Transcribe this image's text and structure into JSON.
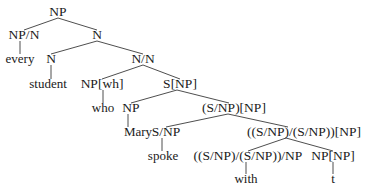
{
  "diagram": {
    "type": "syntax-tree",
    "background": "#ffffff",
    "line_color": "#3a3a3a",
    "nodes": [
      {
        "id": "n0",
        "label": "NP",
        "x": 58,
        "y": 6,
        "kind": "category"
      },
      {
        "id": "n1",
        "label": "NP/N",
        "x": 24,
        "y": 29,
        "kind": "category"
      },
      {
        "id": "n2",
        "label": "every",
        "x": 20,
        "y": 53,
        "kind": "word"
      },
      {
        "id": "n3",
        "label": "N",
        "x": 97,
        "y": 29,
        "kind": "category"
      },
      {
        "id": "n4",
        "label": "N",
        "x": 51,
        "y": 53,
        "kind": "category"
      },
      {
        "id": "n5",
        "label": "student",
        "x": 48,
        "y": 78,
        "kind": "word"
      },
      {
        "id": "n6",
        "label": "N/N",
        "x": 143,
        "y": 53,
        "kind": "category"
      },
      {
        "id": "n7",
        "label": "NP[wh]",
        "x": 102,
        "y": 78,
        "kind": "category"
      },
      {
        "id": "n8",
        "label": "who",
        "x": 103,
        "y": 102,
        "kind": "word"
      },
      {
        "id": "n9",
        "label": "S[NP]",
        "x": 180,
        "y": 78,
        "kind": "category"
      },
      {
        "id": "n10",
        "label": "NP",
        "x": 131,
        "y": 102,
        "kind": "category"
      },
      {
        "id": "n11",
        "label": "Mary",
        "x": 138,
        "y": 126,
        "kind": "word"
      },
      {
        "id": "n12",
        "label": "(S/NP)[NP]",
        "x": 234,
        "y": 102,
        "kind": "category"
      },
      {
        "id": "n13",
        "label": "S/NP",
        "x": 166,
        "y": 126,
        "kind": "category"
      },
      {
        "id": "n14",
        "label": "spoke",
        "x": 163,
        "y": 150,
        "kind": "word"
      },
      {
        "id": "n15",
        "label": "((S/NP)/(S/NP))[NP]",
        "x": 304,
        "y": 126,
        "kind": "category"
      },
      {
        "id": "n16",
        "label": "((S/NP)/(S/NP))/NP",
        "x": 248,
        "y": 150,
        "kind": "category"
      },
      {
        "id": "n17",
        "label": "with",
        "x": 246,
        "y": 173,
        "kind": "word"
      },
      {
        "id": "n18",
        "label": "NP[NP]",
        "x": 333,
        "y": 150,
        "kind": "category"
      },
      {
        "id": "n19",
        "label": "t",
        "x": 333,
        "y": 173,
        "kind": "word"
      }
    ],
    "edges": [
      {
        "from": "n0",
        "to": "n1",
        "x1": 58,
        "y1": 18,
        "x2": 24,
        "y2": 30
      },
      {
        "from": "n0",
        "to": "n3",
        "x1": 58,
        "y1": 18,
        "x2": 97,
        "y2": 30
      },
      {
        "from": "n1",
        "to": "n2",
        "x1": 20,
        "y1": 41,
        "x2": 20,
        "y2": 54
      },
      {
        "from": "n3",
        "to": "n4",
        "x1": 97,
        "y1": 41,
        "x2": 51,
        "y2": 54
      },
      {
        "from": "n3",
        "to": "n6",
        "x1": 97,
        "y1": 41,
        "x2": 143,
        "y2": 54
      },
      {
        "from": "n4",
        "to": "n5",
        "x1": 51,
        "y1": 65,
        "x2": 51,
        "y2": 79
      },
      {
        "from": "n6",
        "to": "n7",
        "x1": 143,
        "y1": 65,
        "x2": 102,
        "y2": 79
      },
      {
        "from": "n6",
        "to": "n9",
        "x1": 143,
        "y1": 65,
        "x2": 180,
        "y2": 79
      },
      {
        "from": "n7",
        "to": "n8",
        "x1": 103,
        "y1": 90,
        "x2": 103,
        "y2": 103
      },
      {
        "from": "n9",
        "to": "n10",
        "x1": 177,
        "y1": 90,
        "x2": 131,
        "y2": 103
      },
      {
        "from": "n9",
        "to": "n12",
        "x1": 177,
        "y1": 90,
        "x2": 229,
        "y2": 103
      },
      {
        "from": "n10",
        "to": "n11",
        "x1": 128,
        "y1": 114,
        "x2": 128,
        "y2": 127
      },
      {
        "from": "n12",
        "to": "n13",
        "x1": 228,
        "y1": 114,
        "x2": 166,
        "y2": 127
      },
      {
        "from": "n12",
        "to": "n15",
        "x1": 228,
        "y1": 114,
        "x2": 288,
        "y2": 127
      },
      {
        "from": "n13",
        "to": "n14",
        "x1": 162,
        "y1": 138,
        "x2": 162,
        "y2": 151
      },
      {
        "from": "n15",
        "to": "n16",
        "x1": 286,
        "y1": 138,
        "x2": 248,
        "y2": 151
      },
      {
        "from": "n15",
        "to": "n18",
        "x1": 286,
        "y1": 138,
        "x2": 333,
        "y2": 151
      },
      {
        "from": "n16",
        "to": "n17",
        "x1": 246,
        "y1": 162,
        "x2": 246,
        "y2": 174
      },
      {
        "from": "n18",
        "to": "n19",
        "x1": 333,
        "y1": 162,
        "x2": 333,
        "y2": 174
      }
    ]
  }
}
